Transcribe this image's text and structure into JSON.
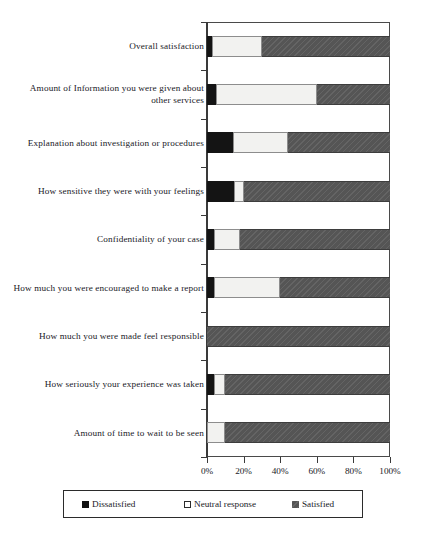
{
  "chart_data": {
    "type": "bar",
    "orientation": "horizontal",
    "stacked": true,
    "stack_mode": "percent",
    "title": "",
    "subtitle": "",
    "xlabel": "",
    "ylabel": "",
    "xlim": [
      0,
      100
    ],
    "grid": false,
    "legend_position": "bottom",
    "categories": [
      "Overall satisfaction",
      "Amount of Information you were given about other services",
      "Explanation about investigation or procedures",
      "How sensitive they were with your feelings",
      "Confidentiality of your case",
      "How much you were encouraged to make a report",
      "How much you were made feel responsible",
      "How seriously your experience was taken",
      "Amount of time to wait to be seen"
    ],
    "series": [
      {
        "name": "Dissatisfied",
        "color": "#141414",
        "values": [
          3,
          5,
          14,
          15,
          4,
          4,
          0,
          4,
          0
        ]
      },
      {
        "name": "Neutral response",
        "color": "#f2f2f0",
        "values": [
          27,
          55,
          30,
          5,
          14,
          36,
          0,
          6,
          10
        ]
      },
      {
        "name": "Satisfied",
        "color": "#555555",
        "values": [
          70,
          40,
          56,
          80,
          82,
          60,
          100,
          90,
          90
        ]
      }
    ],
    "xticks": [
      "0%",
      "20%",
      "40%",
      "60%",
      "80%",
      "100%"
    ],
    "xtick_values": [
      0,
      20,
      40,
      60,
      80,
      100
    ]
  },
  "legend": {
    "items": [
      {
        "label": "Dissatisfied",
        "swatch": "filled-black-square-icon"
      },
      {
        "label": "Neutral response",
        "swatch": "outlined-white-square-icon"
      },
      {
        "label": "Satisfied",
        "swatch": "filled-gray-square-icon"
      }
    ]
  }
}
